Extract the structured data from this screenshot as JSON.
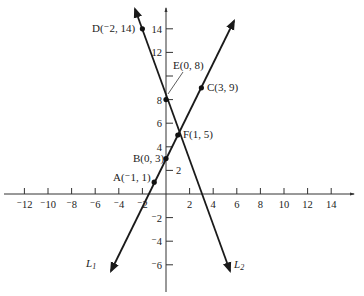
{
  "chart_data": {
    "type": "line",
    "title": "",
    "xlabel": "",
    "ylabel": "",
    "xlim": [
      -14,
      15.5
    ],
    "ylim": [
      -8,
      16
    ],
    "grid": false,
    "origin_px": [
      166,
      194
    ],
    "unit_px": 11.8,
    "x_ticks": [
      -12,
      -10,
      -8,
      -6,
      -4,
      -2,
      2,
      4,
      6,
      8,
      10,
      12,
      14
    ],
    "x_tick_labels": [
      "⁻12",
      "⁻10",
      "⁻8",
      "⁻6",
      "⁻4",
      "⁻2",
      "2",
      "4",
      "6",
      "8",
      "10",
      "12",
      "14"
    ],
    "y_ticks": [
      -6,
      -4,
      -2,
      2,
      4,
      6,
      8,
      10,
      12,
      14
    ],
    "y_tick_labels": [
      "⁻6",
      "⁻4",
      "⁻2",
      "2",
      "4",
      "6",
      "8",
      "",
      "12",
      "14"
    ],
    "series": [
      {
        "name": "L1",
        "label": "L1",
        "equation": "y = 2x + 3",
        "x_range": [
          -4.65,
          5.75
        ],
        "points": [
          {
            "name": "A",
            "label": "A(⁻1, 1)",
            "x": -1,
            "y": 1
          },
          {
            "name": "B",
            "label": "B(0, 3)",
            "x": 0,
            "y": 3
          },
          {
            "name": "F",
            "label": "F(1, 5)",
            "x": 1,
            "y": 5
          },
          {
            "name": "C",
            "label": "C(3, 9)",
            "x": 3,
            "y": 9
          }
        ]
      },
      {
        "name": "L2",
        "label": "L2",
        "equation": "y = -3x + 8",
        "x_range": [
          -2.63,
          5.43
        ],
        "points": [
          {
            "name": "D",
            "label": "D(⁻2, 14)",
            "x": -2,
            "y": 14
          },
          {
            "name": "E",
            "label": "E(0, 8)",
            "x": 0,
            "y": 8
          },
          {
            "name": "F",
            "label": "F(1, 5)",
            "x": 1,
            "y": 5
          }
        ]
      }
    ],
    "annotations": [
      {
        "text": "D(⁻2, 14)",
        "point": [
          -2,
          14
        ]
      },
      {
        "text": "E(0, 8)",
        "point": [
          0,
          8
        ],
        "leader_line": true
      },
      {
        "text": "C(3, 9)",
        "point": [
          3,
          9
        ]
      },
      {
        "text": "F(1, 5)",
        "point": [
          1,
          5
        ]
      },
      {
        "text": "B(0, 3)",
        "point": [
          0,
          3
        ]
      },
      {
        "text": "A(⁻1, 1)",
        "point": [
          -1,
          1
        ]
      },
      {
        "text": "L1",
        "near": "bottom of line L1"
      },
      {
        "text": "L2",
        "near": "bottom of line L2"
      }
    ]
  },
  "labels": {
    "D": "D(⁻2, 14)",
    "E": "E(0, 8)",
    "C": "C(3, 9)",
    "F": "F(1, 5)",
    "B": "B(0, 3)",
    "A": "A(⁻1, 1)",
    "L1_letter": "L",
    "L1_sub": "1",
    "L2_letter": "L",
    "L2_sub": "2"
  },
  "colors": {
    "line": "#1a1a1a",
    "axis": "#333333",
    "text": "#222222",
    "background": "#ffffff"
  }
}
